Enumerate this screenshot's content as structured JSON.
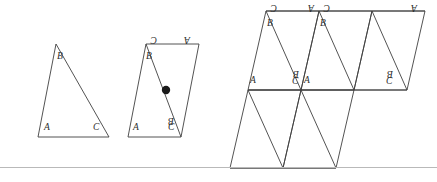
{
  "page": {
    "background_color": "#ffffff",
    "ink_color": "#3a3a3a",
    "label_color": "#2b2b2b"
  },
  "figures": [
    {
      "id": "triangle",
      "name": "triangle-abc",
      "caption": "",
      "vertices": [
        {
          "label": "A",
          "rotation": 0,
          "x": 44,
          "y": 129
        },
        {
          "label": "B",
          "rotation": 0,
          "x": 38,
          "y": 52
        },
        {
          "label": "C",
          "rotation": 0,
          "x": 96,
          "y": 129
        }
      ]
    },
    {
      "id": "parallelogram",
      "name": "parallelogram-with-center-point",
      "caption": "",
      "center_point": {
        "label": "",
        "x": 166,
        "y": 89
      },
      "vertices": [
        {
          "label": "A",
          "rotation": 0
        },
        {
          "label": "B",
          "rotation": 0
        },
        {
          "label": "C",
          "rotation": 0
        },
        {
          "label": "C",
          "rotation": 180
        },
        {
          "label": "B",
          "rotation": 180
        },
        {
          "label": "A",
          "rotation": 180
        }
      ]
    },
    {
      "id": "tiling",
      "name": "parallelogram-tiling",
      "caption": "",
      "vertices": [
        {
          "label": "B",
          "rotation": 0
        },
        {
          "label": "C",
          "rotation": 180
        },
        {
          "label": "A",
          "rotation": 180
        },
        {
          "label": "B",
          "rotation": 0
        },
        {
          "label": "C",
          "rotation": 180
        },
        {
          "label": "A",
          "rotation": 180
        },
        {
          "label": "A",
          "rotation": 0
        },
        {
          "label": "C",
          "rotation": 0
        },
        {
          "label": "B",
          "rotation": 180
        },
        {
          "label": "A",
          "rotation": 0
        },
        {
          "label": "C",
          "rotation": 0
        },
        {
          "label": "B",
          "rotation": 180
        }
      ]
    }
  ],
  "labels": {
    "A": "A",
    "B": "B",
    "C": "C"
  },
  "separator": {
    "present": true,
    "color": "#b9b9b9"
  }
}
